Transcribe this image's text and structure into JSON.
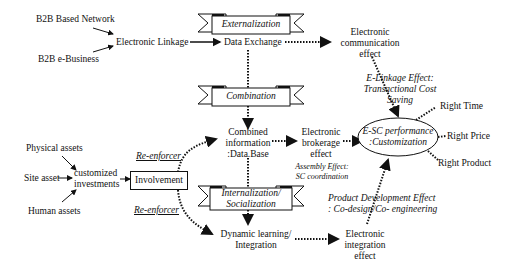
{
  "diagram": {
    "inputs_top": {
      "b2b_network": "B2B Based Network",
      "b2b_ebusiness": "B2B e-Business",
      "electronic_linkage": "Electronic Linkage",
      "data_exchange": "Data Exchange"
    },
    "ribbons": {
      "externalization": "Externalization",
      "combination": "Combination",
      "internalization_l1": "Internalization/",
      "internalization_l2": "Socialization"
    },
    "assets": {
      "physical": "Physical assets",
      "site": "Site asset",
      "human": "Human assets",
      "customized_l1": "customized",
      "customized_l2": "investments",
      "involvement": "Involvement",
      "reenforcer_top": "Re-enforcer",
      "reenforcer_bottom": "Re-enforcer"
    },
    "middle": {
      "combined_l1": "Combined",
      "combined_l2": "information",
      "combined_l3": ":Data.Base",
      "dynamic_l1": "Dynamic learning/",
      "dynamic_l2": "Integration"
    },
    "effects": {
      "comm_l1": "Electronic",
      "comm_l2": "communication",
      "comm_l3": "effect",
      "brokerage_l1": "Electronic",
      "brokerage_l2": "brokerage",
      "brokerage_l3": "effect",
      "integration_l1": "Electronic",
      "integration_l2": "integration",
      "integration_l3": "effect"
    },
    "annotations": {
      "elinkage_l1": "E-Linkage Effect:",
      "elinkage_l2": "Transactional Cost",
      "elinkage_l3": "Saving",
      "assembly_l1": "Assembly  Effect:",
      "assembly_l2": "SC coordination",
      "product_l1": "Product Development  Effect",
      "product_l2": ": Co-design/Co- engineering"
    },
    "outcome": {
      "esc_l1": "E-SC performance",
      "esc_l2": ":Customization",
      "right_time": "Right Time",
      "right_price": "Right Price",
      "right_product": "Right Product"
    }
  }
}
